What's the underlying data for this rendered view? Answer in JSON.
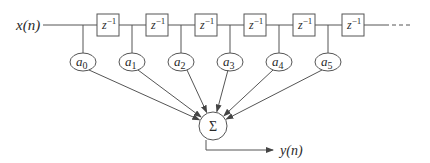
{
  "diagram": {
    "type": "fir-filter-tapped-delay-line",
    "input_label": "x(n)",
    "output_label": "y(n)",
    "delay_label_base": "z",
    "delay_label_exp": "−1",
    "sum_symbol": "Σ",
    "continuation": "dashed",
    "delays": [
      {
        "id": "d1",
        "x": 97
      },
      {
        "id": "d2",
        "x": 146
      },
      {
        "id": "d3",
        "x": 195
      },
      {
        "id": "d4",
        "x": 244
      },
      {
        "id": "d5",
        "x": 293
      },
      {
        "id": "d6",
        "x": 342
      }
    ],
    "coefficients": [
      {
        "label": "a",
        "sub": "0",
        "x": 83
      },
      {
        "label": "a",
        "sub": "1",
        "x": 132
      },
      {
        "label": "a",
        "sub": "2",
        "x": 181
      },
      {
        "label": "a",
        "sub": "3",
        "x": 230
      },
      {
        "label": "a",
        "sub": "4",
        "x": 279
      },
      {
        "label": "a",
        "sub": "5",
        "x": 328
      }
    ],
    "colors": {
      "stroke": "#555555",
      "text": "#2a2a2a",
      "background": "#ffffff"
    }
  }
}
